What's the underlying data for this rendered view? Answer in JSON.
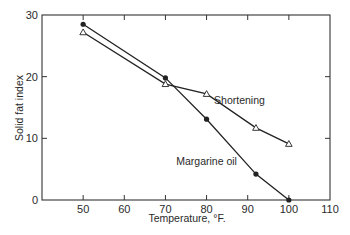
{
  "chart_data": {
    "type": "line",
    "title": "",
    "xlabel": "Temperature, °F.",
    "ylabel": "Solid fat index",
    "xlim": [
      40,
      110
    ],
    "ylim": [
      0,
      30
    ],
    "xticks": [
      50,
      60,
      70,
      80,
      90,
      100,
      110
    ],
    "yticks": [
      0,
      10,
      20,
      30
    ],
    "grid": false,
    "legend": "inline labels",
    "series": [
      {
        "name": "Margarine oil",
        "marker": "filled-circle",
        "x": [
          50,
          70,
          80,
          92,
          100
        ],
        "y": [
          28.5,
          19.8,
          13.1,
          4.2,
          0
        ]
      },
      {
        "name": "Shortening",
        "marker": "open-triangle",
        "x": [
          50,
          70,
          80,
          92,
          100
        ],
        "y": [
          27.2,
          18.8,
          17.2,
          11.7,
          9.1
        ]
      }
    ],
    "annotations": [
      {
        "text": "Shortening",
        "x": 88,
        "y": 15.5
      },
      {
        "text": "Margarine oil",
        "x": 80,
        "y": 5.7
      }
    ]
  },
  "colors": {
    "line": "#222222",
    "axis": "#333333",
    "background": "#ffffff"
  }
}
